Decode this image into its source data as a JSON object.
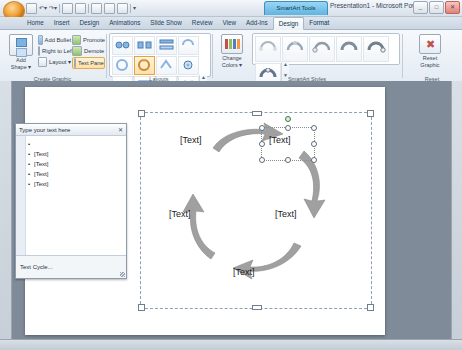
{
  "window": {
    "contextual_tab_title": "SmartArt Tools",
    "title": "Presentation1 - Microsoft Power...",
    "minimize": "_",
    "maximize": "□",
    "close": "✕",
    "office_orb": "office-orb",
    "qat": [
      "save",
      "undo",
      "redo",
      "more"
    ]
  },
  "ribbon": {
    "tabs": [
      {
        "label": "Home",
        "active": false
      },
      {
        "label": "Insert",
        "active": false
      },
      {
        "label": "Design",
        "active": false
      },
      {
        "label": "Animations",
        "active": false
      },
      {
        "label": "Slide Show",
        "active": false
      },
      {
        "label": "Review",
        "active": false
      },
      {
        "label": "View",
        "active": false
      },
      {
        "label": "Add-Ins",
        "active": false
      },
      {
        "label": "Design",
        "active": true
      },
      {
        "label": "Format",
        "active": false
      }
    ],
    "groups": [
      {
        "label": "Create Graphic"
      },
      {
        "label": "Layouts"
      },
      {
        "label": "SmartArt Styles"
      },
      {
        "label": "Reset"
      }
    ],
    "create_graphic": {
      "add_shape": "Add\nShape",
      "add_shape_line1": "Add",
      "add_shape_line2": "Shape ▾",
      "buttons": [
        {
          "label": "Add Bullet"
        },
        {
          "label": "Right to Left"
        },
        {
          "label": "Layout ▾"
        },
        {
          "label": "Promote"
        },
        {
          "label": "Demote"
        },
        {
          "label": "Text Pane"
        }
      ]
    },
    "layouts": {
      "more_up": "▲",
      "more_down": "▼",
      "more_menu": "▾",
      "items": 12,
      "selected_index": 5
    },
    "smartart_styles": {
      "change_colors_line1": "Change",
      "change_colors_line2": "Colors ▾",
      "items": 6,
      "more_up": "▲",
      "more_down": "▼",
      "more_menu": "▾"
    },
    "reset": {
      "line1": "Reset",
      "line2": "Graphic"
    }
  },
  "text_pane": {
    "title": "Type your text here",
    "close": "✕",
    "items": [
      "[Text]",
      "[Text]",
      "[Text]",
      "[Text]",
      "[Text]"
    ],
    "footer": "Text Cycle..."
  },
  "diagram": {
    "type": "basic-cycle",
    "nodes": [
      {
        "label": "[Text]",
        "position": "top-left"
      },
      {
        "label": "[Text]",
        "position": "top-right",
        "selected": true
      },
      {
        "label": "[Text]",
        "position": "right"
      },
      {
        "label": "[Text]",
        "position": "bottom"
      },
      {
        "label": "[Text]",
        "position": "left"
      }
    ],
    "arrow_color": "#9a9a9a",
    "arrow_count": 5
  },
  "colors": {
    "accent": "#4f81bd",
    "contextual_tab": "#5fb4e0",
    "slide_background": "#ffffff",
    "workspace": "#7f8b99"
  }
}
